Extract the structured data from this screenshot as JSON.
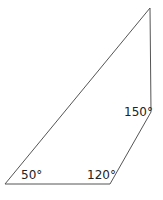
{
  "diagram": {
    "type": "quadrilateral",
    "stroke_color": "#555555",
    "vertices": [
      {
        "name": "top",
        "x": 150,
        "y": 8
      },
      {
        "name": "right",
        "x": 151,
        "y": 112
      },
      {
        "name": "bottom-right",
        "x": 110,
        "y": 184
      },
      {
        "name": "bottom-left",
        "x": 5,
        "y": 184
      }
    ],
    "angles": [
      {
        "label": "150°",
        "vertex": "right"
      },
      {
        "label": "120°",
        "vertex": "bottom-right"
      },
      {
        "label": "50°",
        "vertex": "bottom-left"
      }
    ]
  }
}
